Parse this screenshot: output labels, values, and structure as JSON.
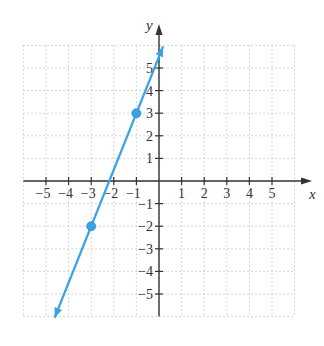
{
  "chart_data": {
    "type": "line",
    "title": "",
    "xlabel": "x",
    "ylabel": "y",
    "xlim": [
      -6,
      6
    ],
    "ylim": [
      -6,
      6
    ],
    "grid": true,
    "grid_style": "dotted",
    "x_ticks": [
      -5,
      -4,
      -3,
      -2,
      -1,
      1,
      2,
      3,
      4,
      5
    ],
    "y_ticks": [
      5,
      4,
      3,
      2,
      1,
      -1,
      -2,
      -3,
      -4,
      -5
    ],
    "x_tick_labels": [
      "−5",
      "−4",
      "−3",
      "−2",
      "−1",
      "1",
      "2",
      "3",
      "4",
      "5"
    ],
    "y_tick_labels": [
      "5",
      "4",
      "3",
      "2",
      "1",
      "−1",
      "−2",
      "−3",
      "−4",
      "−5"
    ],
    "series": [
      {
        "name": "line",
        "equation": "y = 2.5x + 5.5",
        "slope": 2.5,
        "intercept": 5.5,
        "color": "#3aa3e3",
        "arrows": "both",
        "marked_points": [
          {
            "x": -1,
            "y": 3
          },
          {
            "x": -3,
            "y": -2
          }
        ]
      }
    ]
  },
  "colors": {
    "axis": "#333333",
    "grid": "#c8c8c8",
    "line": "#3aa3e3"
  }
}
